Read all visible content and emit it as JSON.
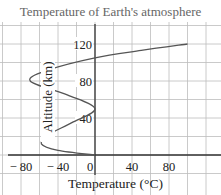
{
  "chart_data": {
    "type": "line",
    "title": "Temperature of Earth's atmosphere",
    "xlabel": "Temperature (°C)",
    "ylabel": "Altitude (km)",
    "x_ticks": [
      "− 80",
      "− 40",
      "0",
      "40",
      "80"
    ],
    "x_tick_values": [
      -80,
      -40,
      0,
      40,
      80
    ],
    "y_ticks": [
      "40",
      "80",
      "120"
    ],
    "y_tick_values": [
      40,
      80,
      120
    ],
    "xlim": [
      -100,
      120
    ],
    "ylim": [
      -20,
      140
    ],
    "grid": true,
    "grid_step": {
      "x": 20,
      "y": 20
    },
    "series": [
      {
        "name": "Temperature profile",
        "points": [
          {
            "temperature": 0,
            "altitude": 0
          },
          {
            "temperature": -40,
            "altitude": 5
          },
          {
            "temperature": -58,
            "altitude": 12
          },
          {
            "temperature": -50,
            "altitude": 22
          },
          {
            "temperature": -25,
            "altitude": 35
          },
          {
            "temperature": 0,
            "altitude": 50
          },
          {
            "temperature": -30,
            "altitude": 65
          },
          {
            "temperature": -70,
            "altitude": 80
          },
          {
            "temperature": -50,
            "altitude": 92
          },
          {
            "temperature": 0,
            "altitude": 105
          },
          {
            "temperature": 50,
            "altitude": 113
          },
          {
            "temperature": 100,
            "altitude": 120
          }
        ]
      }
    ]
  },
  "colors": {
    "grid": "#bdbdbd",
    "axis": "#333333",
    "curve": "#555555",
    "title": "#666666"
  }
}
